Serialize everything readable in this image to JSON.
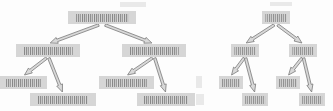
{
  "figure": {
    "kind": "diagram",
    "width": 333,
    "height": 111,
    "background_color": "#fdfdfd",
    "node_fill_color": "#d6d6d6",
    "node_text_color": "#8f8f8f",
    "arrow_fill_color": "#d9d9d9",
    "arrow_stroke_color": "#7a7a7a",
    "text_legibility": "illegible"
  },
  "trees": [
    {
      "id": "tree-left",
      "name": "left-tree",
      "nodes": [
        {
          "id": "L-root",
          "label": "",
          "x": 68,
          "y": 11,
          "w": 68,
          "h": 13,
          "level": 1,
          "density": "dense"
        },
        {
          "id": "L-1",
          "label": "",
          "x": 16,
          "y": 44,
          "w": 64,
          "h": 13,
          "level": 2,
          "density": "dense"
        },
        {
          "id": "L-2",
          "label": "",
          "x": 122,
          "y": 44,
          "w": 64,
          "h": 13,
          "level": 2,
          "density": "dense"
        },
        {
          "id": "L-1a",
          "label": "",
          "x": 0,
          "y": 76,
          "w": 47,
          "h": 13,
          "level": 3,
          "density": "dense"
        },
        {
          "id": "L-1b",
          "label": "",
          "x": 30,
          "y": 93,
          "w": 66,
          "h": 13,
          "level": 4,
          "density": "dense"
        },
        {
          "id": "L-2a",
          "label": "",
          "x": 99,
          "y": 76,
          "w": 55,
          "h": 13,
          "level": 3,
          "density": "dense"
        },
        {
          "id": "L-2b",
          "label": "",
          "x": 137,
          "y": 93,
          "w": 58,
          "h": 13,
          "level": 4,
          "density": "dense"
        }
      ],
      "edges": [
        {
          "from": "L-root",
          "to": "L-1"
        },
        {
          "from": "L-root",
          "to": "L-2"
        },
        {
          "from": "L-1",
          "to": "L-1a"
        },
        {
          "from": "L-1",
          "to": "L-1b"
        },
        {
          "from": "L-2",
          "to": "L-2a"
        },
        {
          "from": "L-2",
          "to": "L-2b"
        }
      ]
    },
    {
      "id": "tree-right",
      "name": "right-tree",
      "nodes": [
        {
          "id": "R-root",
          "label": "",
          "x": 262,
          "y": 11,
          "w": 28,
          "h": 13,
          "level": 1,
          "density": "normal"
        },
        {
          "id": "R-1",
          "label": "",
          "x": 231,
          "y": 44,
          "w": 28,
          "h": 13,
          "level": 2,
          "density": "normal"
        },
        {
          "id": "R-2",
          "label": "",
          "x": 289,
          "y": 44,
          "w": 28,
          "h": 13,
          "level": 2,
          "density": "normal"
        },
        {
          "id": "R-1a",
          "label": "",
          "x": 219,
          "y": 76,
          "w": 24,
          "h": 13,
          "level": 3,
          "density": "normal"
        },
        {
          "id": "R-1b",
          "label": "",
          "x": 242,
          "y": 93,
          "w": 26,
          "h": 13,
          "level": 4,
          "density": "normal"
        },
        {
          "id": "R-2a",
          "label": "",
          "x": 276,
          "y": 76,
          "w": 24,
          "h": 13,
          "level": 3,
          "density": "normal"
        },
        {
          "id": "R-2b",
          "label": "",
          "x": 299,
          "y": 93,
          "w": 26,
          "h": 13,
          "level": 4,
          "density": "normal"
        }
      ],
      "edges": [
        {
          "from": "R-root",
          "to": "R-1"
        },
        {
          "from": "R-root",
          "to": "R-2"
        },
        {
          "from": "R-1",
          "to": "R-1a"
        },
        {
          "from": "R-1",
          "to": "R-1b"
        },
        {
          "from": "R-2",
          "to": "R-2a"
        },
        {
          "from": "R-2",
          "to": "R-2b"
        }
      ]
    }
  ],
  "artifacts": [
    {
      "id": "speck-1",
      "x": 120,
      "y": 2,
      "w": 26,
      "h": 5
    },
    {
      "id": "speck-2",
      "x": 270,
      "y": 2,
      "w": 22,
      "h": 4
    },
    {
      "id": "speck-3",
      "x": 196,
      "y": 76,
      "w": 6,
      "h": 12
    },
    {
      "id": "speck-4",
      "x": 196,
      "y": 94,
      "w": 8,
      "h": 11
    }
  ]
}
